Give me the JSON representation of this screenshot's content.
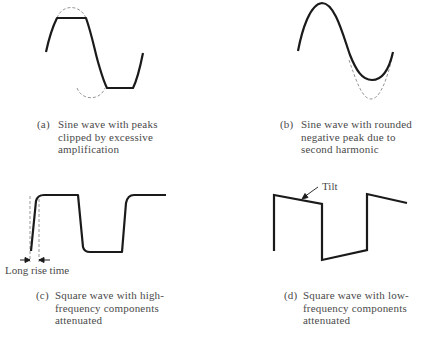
{
  "figure": {
    "panels": [
      {
        "id": "a",
        "tag": "(a)",
        "caption_lines": [
          "Sine wave with peaks",
          "clipped by excessive",
          "amplification"
        ],
        "waveform": "clipped-sine"
      },
      {
        "id": "b",
        "tag": "(b)",
        "caption_lines": [
          "Sine wave with rounded",
          "negative peak due to",
          "second harmonic"
        ],
        "waveform": "second-harmonic-sine"
      },
      {
        "id": "c",
        "tag": "(c)",
        "caption_lines": [
          "Square wave with high-",
          "frequency components",
          "attenuated"
        ],
        "waveform": "rounded-square",
        "annotation": "Long rise time"
      },
      {
        "id": "d",
        "tag": "(d)",
        "caption_lines": [
          "Square wave with low-",
          "frequency components",
          "attenuated"
        ],
        "waveform": "tilted-square",
        "annotation": "Tilt"
      }
    ],
    "colors": {
      "trace": "#1a1a1a",
      "reference_dashed": "#8a8a8a",
      "caption_text": "#4a4a4a"
    }
  }
}
